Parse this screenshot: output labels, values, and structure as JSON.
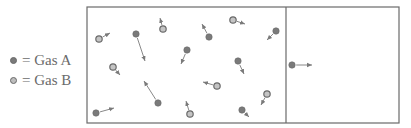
{
  "legend": {
    "items": [
      {
        "symbol": "solid-dot",
        "label": "= Gas A"
      },
      {
        "symbol": "hollow-dot",
        "label": "= Gas B"
      }
    ]
  },
  "colors": {
    "border": "#6a6a6a",
    "gas_a_fill": "#7a7a7a",
    "gas_b_fill": "#c4c4c4",
    "arrow": "#7a7a7a",
    "legend_text": "#6b6b6b"
  },
  "container": {
    "left": 87,
    "top": 7,
    "right": 399,
    "bottom": 123,
    "divider_x": 286,
    "left_chamber": "gas mixture",
    "right_chamber": "empty"
  },
  "particles": [
    {
      "gas": "B",
      "x": 99,
      "y": 39,
      "ax": 110,
      "ay": 33
    },
    {
      "gas": "A",
      "x": 136,
      "y": 34,
      "ax": 145,
      "ay": 61
    },
    {
      "gas": "B",
      "x": 163,
      "y": 29,
      "ax": 160,
      "ay": 18
    },
    {
      "gas": "A",
      "x": 209,
      "y": 37,
      "ax": 202,
      "ay": 24
    },
    {
      "gas": "A",
      "x": 187,
      "y": 50,
      "ax": 181,
      "ay": 64
    },
    {
      "gas": "B",
      "x": 233,
      "y": 20,
      "ax": 245,
      "ay": 24
    },
    {
      "gas": "A",
      "x": 276,
      "y": 31,
      "ax": 267,
      "ay": 40
    },
    {
      "gas": "A",
      "x": 238,
      "y": 61,
      "ax": 244,
      "ay": 74
    },
    {
      "gas": "B",
      "x": 113,
      "y": 67,
      "ax": 120,
      "ay": 75
    },
    {
      "gas": "A",
      "x": 158,
      "y": 103,
      "ax": 144,
      "ay": 81
    },
    {
      "gas": "A",
      "x": 96,
      "y": 113,
      "ax": 114,
      "ay": 108
    },
    {
      "gas": "B",
      "x": 217,
      "y": 86,
      "ax": 203,
      "ay": 82
    },
    {
      "gas": "B",
      "x": 190,
      "y": 114,
      "ax": 186,
      "ay": 101
    },
    {
      "gas": "B",
      "x": 267,
      "y": 94,
      "ax": 261,
      "ay": 105
    },
    {
      "gas": "A",
      "x": 242,
      "y": 110,
      "ax": 249,
      "ay": 117
    },
    {
      "gas": "A",
      "x": 292,
      "y": 65,
      "ax": 312,
      "ay": 65
    }
  ]
}
